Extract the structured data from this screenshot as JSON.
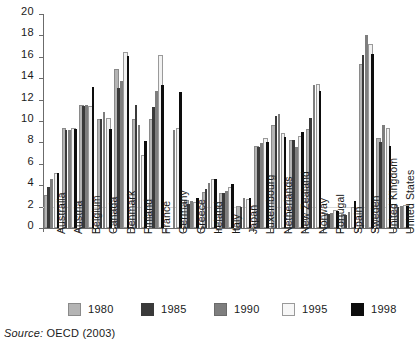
{
  "chart_data": {
    "type": "bar",
    "title": "",
    "subtitle": "",
    "xlabel": "",
    "ylabel": "",
    "ylim": [
      0,
      20
    ],
    "ytick_step": 2,
    "yticks": [
      20,
      18,
      16,
      14,
      12,
      10,
      8,
      6,
      4,
      2,
      0
    ],
    "grid": true,
    "grid_note": "single faint horizontal gridline at y=2",
    "legend_position": "bottom",
    "categories": [
      "Australia",
      "Austria",
      "Belgium",
      "Canada",
      "Denmark",
      "Finland",
      "France",
      "Germany",
      "Greece",
      "Ireland",
      "Italy",
      "Japan",
      "Luxembourg",
      "Netherlands",
      "New Zealand",
      "Norway",
      "Portugal",
      "Spain",
      "Sweden",
      "United Kingdom",
      "United States"
    ],
    "series": [
      {
        "name": "1980",
        "color": "#b4b4b4",
        "values": [
          2.9,
          9.2,
          11.3,
          10.0,
          14.7,
          10.0,
          10.0,
          null,
          2.4,
          3.2,
          3.1,
          1.9,
          7.5,
          9.4,
          8.0,
          9.1,
          1.2,
          1.1,
          15.1,
          8.2,
          2.0
        ]
      },
      {
        "name": "1985",
        "color": "#3a3a3a",
        "values": [
          3.8,
          9.2,
          11.4,
          10.2,
          13.1,
          11.5,
          11.3,
          null,
          2.2,
          3.6,
          3.3,
          2.0,
          7.6,
          10.5,
          8.2,
          10.3,
          1.3,
          1.2,
          16.2,
          8.0,
          2.0
        ]
      },
      {
        "name": "1990",
        "color": "#7e7e7e",
        "values": [
          4.6,
          9.2,
          11.5,
          10.8,
          13.7,
          9.6,
          12.8,
          9.2,
          2.5,
          4.2,
          3.5,
          2.8,
          7.9,
          10.7,
          7.6,
          13.4,
          1.4,
          1.5,
          18.0,
          9.6,
          2.1
        ]
      },
      {
        "name": "1995",
        "color": "#f2f2f2",
        "values": [
          5.0,
          9.2,
          11.2,
          10.1,
          16.3,
          6.6,
          16.0,
          9.2,
          2.2,
          4.4,
          3.6,
          2.5,
          8.2,
          8.7,
          8.4,
          13.3,
          1.5,
          1.8,
          17.0,
          9.2,
          2.0
        ]
      },
      {
        "name": "1998",
        "color": "#0d0d0d",
        "values": [
          5.1,
          9.3,
          13.2,
          9.3,
          16.1,
          8.1,
          13.4,
          12.7,
          2.8,
          4.6,
          4.1,
          2.8,
          8.0,
          8.5,
          9.0,
          12.8,
          1.6,
          2.5,
          16.3,
          7.7,
          2.1
        ]
      }
    ]
  },
  "legend": {
    "items": [
      {
        "label": "1980",
        "swatch": "y1980"
      },
      {
        "label": "1985",
        "swatch": "y1985"
      },
      {
        "label": "1990",
        "swatch": "y1990"
      },
      {
        "label": "1995",
        "swatch": "y1995"
      },
      {
        "label": "1998",
        "swatch": "y1998"
      }
    ]
  },
  "source": {
    "prefix": "Source:",
    "text": " OECD (2003)",
    "full": "Source: OECD (2003)"
  }
}
